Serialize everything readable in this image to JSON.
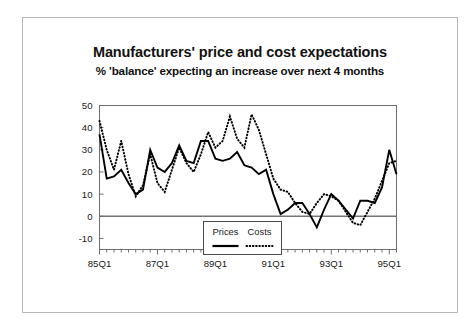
{
  "figure": {
    "title": "Manufacturers' price and cost expectations",
    "subtitle": "% 'balance' expecting an increase over next 4 months",
    "frame_color": "#b9b9b9",
    "background": "#ffffff"
  },
  "legend": {
    "position": "inside-bottom-center",
    "entries": [
      {
        "label": "Prices",
        "style": "solid",
        "color": "#000000"
      },
      {
        "label": "Costs",
        "style": "dotted",
        "color": "#000000"
      }
    ]
  },
  "chart_data": {
    "type": "line",
    "title": "Manufacturers' price and cost expectations",
    "subtitle": "% 'balance' expecting an increase over next 4 months",
    "xlabel": "",
    "ylabel": "",
    "ylim": [
      -15,
      50
    ],
    "yticks": [
      -10,
      0,
      10,
      20,
      30,
      40,
      50
    ],
    "ytick_labels": [
      "-10",
      "0",
      "10",
      "20",
      "30",
      "40",
      "50"
    ],
    "xtick_labels": [
      "85Q1",
      "87Q1",
      "89Q1",
      "91Q1",
      "93Q1",
      "95Q1"
    ],
    "xtick_indices": [
      0,
      8,
      16,
      24,
      32,
      40
    ],
    "grid": false,
    "zero_line": true,
    "x": [
      "85Q1",
      "85Q2",
      "85Q3",
      "85Q4",
      "86Q1",
      "86Q2",
      "86Q3",
      "86Q4",
      "87Q1",
      "87Q2",
      "87Q3",
      "87Q4",
      "88Q1",
      "88Q2",
      "88Q3",
      "88Q4",
      "89Q1",
      "89Q2",
      "89Q3",
      "89Q4",
      "90Q1",
      "90Q2",
      "90Q3",
      "90Q4",
      "91Q1",
      "91Q2",
      "91Q3",
      "91Q4",
      "92Q1",
      "92Q2",
      "92Q3",
      "92Q4",
      "93Q1",
      "93Q2",
      "93Q3",
      "93Q4",
      "94Q1",
      "94Q2",
      "94Q3",
      "94Q4",
      "95Q1",
      "95Q2"
    ],
    "series": [
      {
        "name": "Prices",
        "style": "solid",
        "color": "#000000",
        "values": [
          37,
          17,
          18,
          21,
          15,
          10,
          12,
          30,
          22,
          20,
          24,
          32,
          25,
          24,
          34,
          34,
          26,
          25,
          26,
          29,
          23,
          22,
          19,
          21,
          10,
          1,
          3,
          6,
          6,
          1,
          -5,
          3,
          10,
          7,
          3,
          -1,
          7,
          7,
          6,
          13,
          30,
          19
        ]
      },
      {
        "name": "Costs",
        "style": "dotted",
        "color": "#000000",
        "values": [
          43,
          30,
          21,
          34,
          19,
          9,
          14,
          28,
          15,
          11,
          21,
          31,
          24,
          20,
          28,
          38,
          31,
          34,
          45,
          35,
          31,
          46,
          39,
          28,
          17,
          12,
          11,
          6,
          2,
          1,
          6,
          10,
          9,
          7,
          2,
          -3,
          -4,
          2,
          8,
          16,
          24,
          25
        ]
      }
    ]
  }
}
